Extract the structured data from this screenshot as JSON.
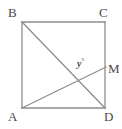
{
  "figure": {
    "kind": "geometry-diagram",
    "width": 122,
    "height": 129,
    "background_color": "#ffffff",
    "stroke_color": "#8d8d8d",
    "label_color": "#4a4a4a",
    "stroke_width": 1.3
  },
  "labels": {
    "B": "B",
    "C": "C",
    "A": "A",
    "D": "D",
    "M": "M",
    "angle_y": "y",
    "degree_symbol": "°"
  },
  "points": {
    "B": {
      "x": 22,
      "y": 22
    },
    "C": {
      "x": 105,
      "y": 22
    },
    "A": {
      "x": 22,
      "y": 108
    },
    "D": {
      "x": 105,
      "y": 108
    },
    "M": {
      "x": 105,
      "y": 68
    },
    "intersection": {
      "x": 67,
      "y": 78
    }
  },
  "segments": [
    {
      "name": "side-BC",
      "from": "B",
      "to": "C"
    },
    {
      "name": "side-CD",
      "from": "C",
      "to": "D"
    },
    {
      "name": "side-DA",
      "from": "D",
      "to": "A"
    },
    {
      "name": "side-AB",
      "from": "A",
      "to": "B"
    },
    {
      "name": "diagonal-BD",
      "from": "B",
      "to": "D"
    },
    {
      "name": "segment-AM",
      "from": "A",
      "to": "M"
    }
  ]
}
